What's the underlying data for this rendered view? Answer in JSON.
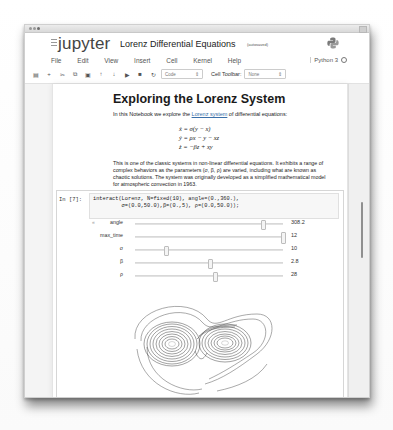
{
  "window": {
    "title": "Lorenz Differential Equations"
  },
  "header": {
    "logo_text": "jupyter",
    "notebook_title": "Lorenz Differential Equations",
    "save_status": "(autosaved)",
    "kernel_name": "Python 3"
  },
  "menubar": {
    "items": [
      "File",
      "Edit",
      "View",
      "Insert",
      "Cell",
      "Kernel",
      "Help"
    ]
  },
  "toolbar": {
    "buttons": [
      {
        "name": "save",
        "glyph": "▤"
      },
      {
        "name": "insert-cell-below",
        "glyph": "+"
      },
      {
        "name": "cut",
        "glyph": "✂"
      },
      {
        "name": "copy",
        "glyph": "⧉"
      },
      {
        "name": "paste",
        "glyph": "▣"
      },
      {
        "name": "move-up",
        "glyph": "↑"
      },
      {
        "name": "move-down",
        "glyph": "↓"
      },
      {
        "name": "run",
        "glyph": "▶"
      },
      {
        "name": "interrupt",
        "glyph": "■"
      },
      {
        "name": "restart",
        "glyph": "↻"
      }
    ],
    "cell_type": "Code",
    "cell_toolbar_label": "Cell Toolbar:",
    "cell_toolbar_value": "None"
  },
  "markdown": {
    "heading": "Exploring the Lorenz System",
    "intro_before": "In this Notebook we explore the ",
    "intro_link": "Lorenz system",
    "intro_after": " of differential equations:",
    "equations": [
      "ẋ = σ(y − x)",
      "ẏ = ρx − y − xz",
      "ż = −βz + xy"
    ],
    "paragraph": "This is one of the classic systems in non-linear differential equations. It exhibits a range of complex behaviors as the parameters (σ, β, ρ) are varied, including what are known as chaotic solutions. The system was originally developed as a simplified mathematical model for atmospheric convection in 1963."
  },
  "code_cell": {
    "prompt": "In [7]:",
    "code_line1": "interact(Lorenz, N=fixed(10), angle=(0.,360.),",
    "code_line2": "         σ=(0.0,50.0),β=(0.,5), ρ=(0.0,50.0));",
    "collapse_glyph": "«"
  },
  "sliders": [
    {
      "label": "angle",
      "value": "308.2",
      "position": 0.86
    },
    {
      "label": "max_time",
      "value": "12",
      "position": 1.0
    },
    {
      "label": "σ",
      "value": "10",
      "position": 0.2
    },
    {
      "label": "β",
      "value": "2.8",
      "position": 0.56
    },
    {
      "label": "ρ",
      "value": "28",
      "position": 0.56
    }
  ],
  "plot": {
    "description": "Lorenz attractor trajectories (butterfly)",
    "line_color": "#3a3a3a"
  }
}
